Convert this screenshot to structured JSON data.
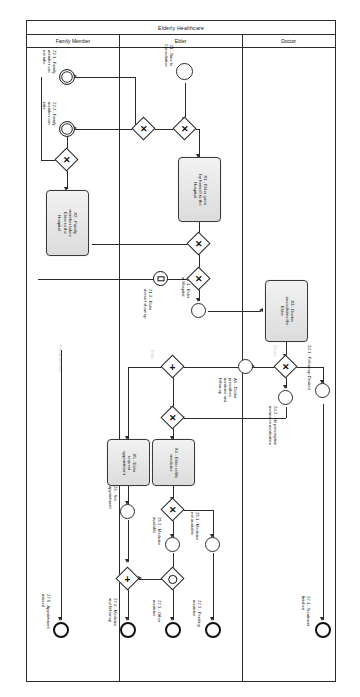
{
  "diagram": {
    "type": "bpmn-collaboration-diagram",
    "pool_title": "Elderly Healthcare",
    "lanes": [
      {
        "id": "family",
        "label": "Family Member"
      },
      {
        "id": "elder",
        "label": "Elder"
      },
      {
        "id": "doctor",
        "label": "Doctor"
      }
    ],
    "lane_ghosts": [
      {
        "label": "Family Member"
      },
      {
        "label": "Elder"
      },
      {
        "label": "Doctor"
      }
    ]
  },
  "events": {
    "z1": {
      "label": "Z1 - Time to\nConsultation",
      "kind": "start"
    },
    "z21": {
      "label": "Z2.1 - Family\nmember can\nnot take",
      "kind": "intermediate"
    },
    "z22": {
      "label": "Z2.2 - Family\nmember can\ntake",
      "kind": "intermediate"
    },
    "z12": {
      "label": "Z1.2 - Elder\ndoesn't show up",
      "kind": "intermediate-message"
    },
    "z11": {
      "label": "Z1.1 - Elder\nat Hospital",
      "kind": "intermediate"
    },
    "a1": {
      "label": "A1 - Doctor\nprescribes\nmedicine and\nfollow-up",
      "kind": "intermediate"
    },
    "z41": {
      "label": "Z4.1 - Follow-up Desired",
      "kind": "intermediate"
    },
    "z42": {
      "label": "Z4.2 - No prescription\nmeans no medication",
      "kind": "intermediate"
    },
    "z6": {
      "label": "Z6 - Set\nappointment",
      "kind": "intermediate"
    },
    "z52": {
      "label": "Z5.2 - Medicine\navailable",
      "kind": "intermediate"
    },
    "z51": {
      "label": "Z5.1 - Medicine\nnot available",
      "kind": "intermediate"
    },
    "z75": {
      "label": "Z7.5 - Appointment\nmissed",
      "kind": "end"
    },
    "z74": {
      "label": "Z7.4 - Medicine\nand follow-up",
      "kind": "end"
    },
    "z73": {
      "label": "Z7.3 - Other\nmedicine",
      "kind": "end"
    },
    "z72": {
      "label": "Z7.2 - Pending\nmedicine",
      "kind": "end"
    },
    "z71": {
      "label": "Z7.1 - Treatment\nfinished",
      "kind": "end"
    }
  },
  "tasks": {
    "x1": {
      "label": "X1 - Elder goes\nby himself to the\nHospital"
    },
    "x2": {
      "label": "X2 - Family\nmember takes\nElder to the\nHospital"
    },
    "x3": {
      "label": "X3 - Doctor\nauscultates the\nElder"
    },
    "x4": {
      "label": "X4 - Elder refills\nmedicine"
    },
    "x5": {
      "label": "X5 - Elder\nrequest\nappointment"
    }
  },
  "gateways": {
    "g1": {
      "type": "exclusive",
      "mark": "✕"
    },
    "g2": {
      "type": "exclusive",
      "mark": "✕"
    },
    "g3": {
      "type": "exclusive",
      "mark": "✕"
    },
    "g4": {
      "type": "exclusive",
      "mark": "✕"
    },
    "g5": {
      "type": "exclusive",
      "mark": "✕"
    },
    "g6": {
      "type": "parallel",
      "mark": "+"
    },
    "g7": {
      "type": "exclusive",
      "mark": "✕"
    },
    "g8": {
      "type": "exclusive",
      "mark": "✕"
    },
    "g9": {
      "type": "exclusive",
      "mark": "✕"
    },
    "g10": {
      "type": "parallel",
      "mark": "+"
    },
    "g11": {
      "type": "event-based",
      "mark": ""
    }
  },
  "colors": {
    "stroke": "#2b2b2b",
    "task_fill_top": "#f2f2f2",
    "task_fill_bottom": "#dcdcdc",
    "background": "#ffffff",
    "ghost_text": "#c9c9c9"
  }
}
